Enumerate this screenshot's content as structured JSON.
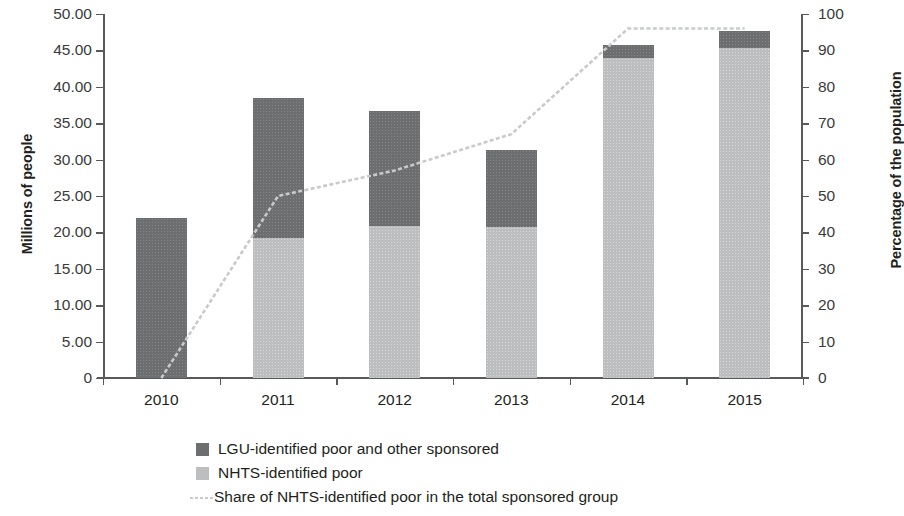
{
  "chart_data": {
    "type": "bar",
    "subtype": "stacked-bar-with-line",
    "title": "",
    "xlabel": "",
    "ylabel": "Millions of people",
    "y2label": "Percentage of the population",
    "categories": [
      "2010",
      "2011",
      "2012",
      "2013",
      "2014",
      "2015"
    ],
    "ylim": [
      0,
      50
    ],
    "y2lim": [
      0,
      100
    ],
    "yticks": [
      "0",
      "5.00",
      "10.00",
      "15.00",
      "20.00",
      "25.00",
      "30.00",
      "35.00",
      "40.00",
      "45.00",
      "50.00"
    ],
    "ytick_values": [
      0,
      5,
      10,
      15,
      20,
      25,
      30,
      35,
      40,
      45,
      50
    ],
    "y2ticks": [
      "0",
      "10",
      "20",
      "30",
      "40",
      "50",
      "60",
      "70",
      "80",
      "90",
      "100"
    ],
    "y2tick_values": [
      0,
      10,
      20,
      30,
      40,
      50,
      60,
      70,
      80,
      90,
      100
    ],
    "grid": false,
    "legend_position": "bottom",
    "series": [
      {
        "name": "NHTS-identified poor",
        "type": "bar",
        "axis": "left",
        "color": "#bcbec0",
        "values": [
          0.0,
          19.3,
          20.9,
          20.8,
          44.0,
          45.4
        ]
      },
      {
        "name": "LGU-identified poor and other sponsored",
        "type": "bar",
        "axis": "left",
        "color": "#6d6e70",
        "values": [
          22.0,
          19.1,
          15.8,
          10.5,
          1.8,
          2.3
        ]
      },
      {
        "name": "Share of NHTS-identified poor in the total sponsored group",
        "type": "line",
        "axis": "right",
        "color": "#c9cacc",
        "values": [
          0,
          50,
          57,
          67,
          96,
          96
        ]
      }
    ],
    "totals": [
      22.0,
      38.4,
      36.7,
      31.3,
      45.8,
      47.7
    ]
  },
  "axes": {
    "left_title": "Millions of people",
    "right_title": "Percentage of the population"
  },
  "legend": {
    "items": [
      {
        "label": "LGU-identified poor and other sponsored",
        "marker": "square",
        "color": "#6d6e70"
      },
      {
        "label": "NHTS-identified poor",
        "marker": "square",
        "color": "#bcbec0"
      },
      {
        "label": "Share of NHTS-identified poor in the total sponsored group",
        "marker": "dashed-line",
        "color": "#c9cacc"
      }
    ]
  }
}
